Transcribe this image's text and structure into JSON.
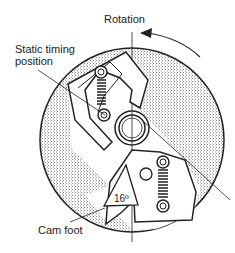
{
  "diagram": {
    "labels": {
      "rotation": "Rotation",
      "static_timing_line1": "Static timing",
      "static_timing_line2": "position",
      "angle": "16º",
      "cam_foot": "Cam foot"
    },
    "colors": {
      "line": "#222222",
      "hatch": "#9a9a9a",
      "background": "#ffffff"
    }
  }
}
